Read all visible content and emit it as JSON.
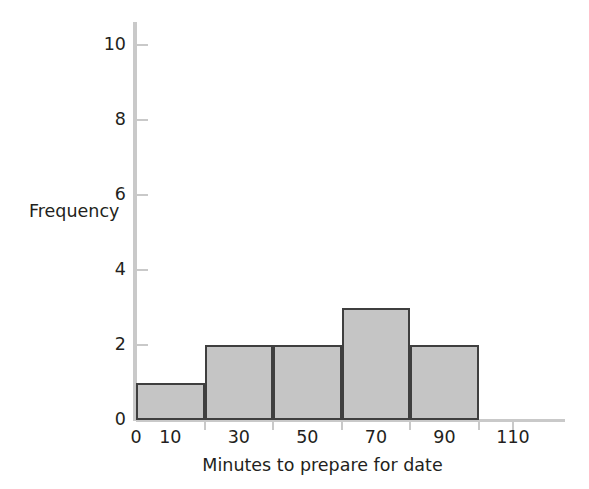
{
  "chart_data": {
    "type": "bar",
    "chart_subtype": "histogram",
    "title": "",
    "xlabel": "Minutes to prepare for date",
    "ylabel": "Frequency",
    "bin_width": 20,
    "bin_edges": [
      0,
      20,
      40,
      60,
      80,
      100
    ],
    "categories": [
      "0-20",
      "20-40",
      "40-60",
      "60-80",
      "80-100"
    ],
    "values": [
      1,
      2,
      2,
      3,
      2
    ],
    "bars": [
      {
        "left": 0,
        "right": 20,
        "height": 1
      },
      {
        "left": 20,
        "right": 40,
        "height": 2
      },
      {
        "left": 40,
        "right": 60,
        "height": 2
      },
      {
        "left": 60,
        "right": 80,
        "height": 3
      },
      {
        "left": 80,
        "right": 100,
        "height": 2
      }
    ],
    "xlim": [
      0,
      125
    ],
    "ylim": [
      0,
      10.6
    ],
    "x_tick_values": [
      0,
      10,
      30,
      50,
      70,
      90,
      110
    ],
    "x_tick_labels": [
      "0",
      "10",
      "30",
      "50",
      "70",
      "90",
      "110"
    ],
    "x_tick_mark_values": [
      20,
      40,
      60,
      80,
      100,
      110
    ],
    "y_tick_values": [
      0,
      2,
      4,
      6,
      8,
      10
    ],
    "y_tick_labels": [
      "0",
      "2",
      "4",
      "6",
      "8",
      "10"
    ],
    "grid": false,
    "legend": false,
    "total_count": 10,
    "colors": {
      "bar_fill": "#c5c5c5",
      "bar_border": "#3f3f3f",
      "axis_line": "#c9c9c9",
      "text": "#231f20",
      "background": "#ffffff"
    }
  }
}
